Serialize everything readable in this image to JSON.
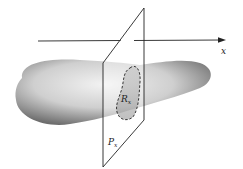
{
  "figure": {
    "axis_label": "x",
    "plane_label_main": "P",
    "plane_label_sub": "x",
    "region_label_main": "R",
    "region_label_sub": "x"
  },
  "colors": {
    "ink": "#222222",
    "solid_light": "#e8e8e8",
    "solid_dark": "#7a7a7a",
    "background": "#ffffff"
  }
}
